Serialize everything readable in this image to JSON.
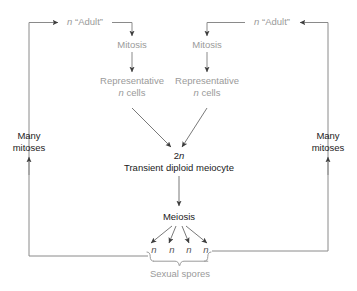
{
  "figure": {
    "type": "life-cycle-diagram",
    "background_color": "#ffffff",
    "grey_text_color": "#9a9a9a",
    "dark_text_color": "#1a1a1a",
    "line_color": "#808080",
    "arrow_color": "#404040"
  },
  "nodes": {
    "adult_left": {
      "italic_prefix": "n",
      "label": " “Adult”",
      "full": "n “Adult”",
      "style": "grey"
    },
    "adult_right": {
      "italic_prefix": "n",
      "label": " “Adult”",
      "full": "n “Adult”",
      "style": "grey"
    },
    "mitosis_left": {
      "label": "Mitosis",
      "style": "grey"
    },
    "mitosis_right": {
      "label": "Mitosis",
      "style": "grey"
    },
    "representative_left": {
      "line1": "Representative",
      "italic_prefix": "n",
      "line2_rest": " cells",
      "line2": "n cells",
      "style": "grey"
    },
    "representative_right": {
      "line1": "Representative",
      "italic_prefix": "n",
      "line2_rest": " cells",
      "line2": "n cells",
      "style": "grey"
    },
    "meiocyte": {
      "ploidy_prefix": "2",
      "ploidy_italic": "n",
      "ploidy": "2n",
      "label": "Transient diploid meiocyte",
      "style": "dark"
    },
    "meiosis": {
      "label": "Meiosis",
      "style": "dark"
    },
    "many_mitoses_left": {
      "line1": "Many",
      "line2": "mitoses",
      "style": "dark"
    },
    "many_mitoses_right": {
      "line1": "Many",
      "line2": "mitoses",
      "style": "dark"
    },
    "sexual_spores": {
      "label": "Sexual spores",
      "style": "grey"
    }
  },
  "spores": {
    "count": 4,
    "symbol": "n",
    "symbols": [
      "n",
      "n",
      "n",
      "n"
    ],
    "brace_label": "Sexual spores"
  }
}
